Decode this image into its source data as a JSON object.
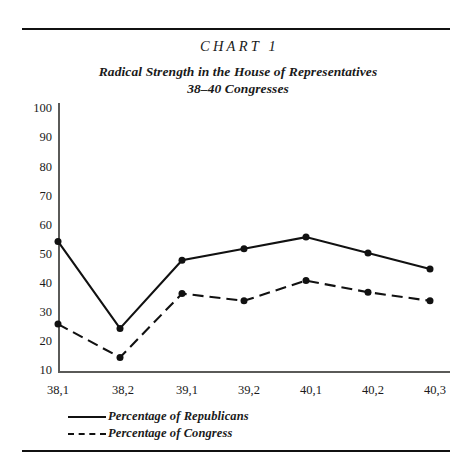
{
  "figure": {
    "chart_label": "CHART 1",
    "subtitle_line_1": "Radical Strength in the House of Representatives",
    "subtitle_line_2": "38–40 Congresses"
  },
  "legend": {
    "items": [
      {
        "label": "Percentage of Republicans",
        "style": "solid",
        "swatch": "solid-line-swatch"
      },
      {
        "label": "Percentage of Congress",
        "style": "dashed",
        "swatch": "dashed-line-swatch"
      }
    ]
  },
  "axes": {
    "y_ticks": [
      "100",
      "90",
      "80",
      "70",
      "60",
      "50",
      "40",
      "30",
      "20",
      "10"
    ],
    "x_ticks": [
      "38,1",
      "38,2",
      "39,1",
      "39,2",
      "40,1",
      "40,2",
      "40,3"
    ]
  },
  "colors": {
    "ink": "#111111",
    "axis": "#5a5a58",
    "background": "#ffffff"
  },
  "chart_data": {
    "type": "line",
    "title": "CHART 1",
    "subtitle": "Radical Strength in the House of Representatives, 38–40 Congresses",
    "xlabel": "",
    "ylabel": "",
    "x": [
      "38,1",
      "38,2",
      "39,1",
      "39,2",
      "40,1",
      "40,2",
      "40,3"
    ],
    "categories": [
      "38,1",
      "38,2",
      "39,1",
      "39,2",
      "40,1",
      "40,2",
      "40,3"
    ],
    "ylim": [
      0,
      100
    ],
    "xlim": [
      0,
      6
    ],
    "y_ticks": [
      10,
      20,
      30,
      40,
      50,
      60,
      70,
      80,
      90,
      100
    ],
    "grid": false,
    "legend_position": "below-axis-left",
    "markers": "filled-circle",
    "series": [
      {
        "name": "Percentage of Republicans",
        "style": "solid",
        "values": [
          54,
          24,
          47.5,
          51.5,
          55.5,
          50,
          44.5
        ]
      },
      {
        "name": "Percentage of Congress",
        "style": "dashed",
        "values": [
          25.5,
          14,
          36,
          33.5,
          40.5,
          36.5,
          33.5
        ]
      }
    ]
  }
}
